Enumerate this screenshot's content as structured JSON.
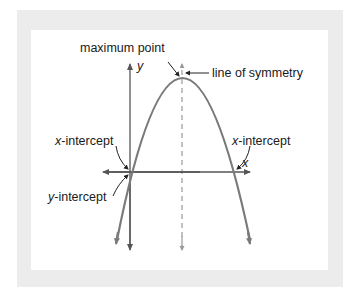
{
  "diagram": {
    "labels": {
      "maximum_point": "maximum point",
      "line_of_symmetry": "line of symmetry",
      "x_intercept_left_var": "x",
      "x_intercept_left_rest": "-intercept",
      "x_intercept_right_var": "x",
      "x_intercept_right_rest": "-intercept",
      "y_intercept_var": "y",
      "y_intercept_rest": "-intercept",
      "x_axis": "x",
      "y_axis": "y"
    },
    "colors": {
      "frame": "#ececec",
      "panel": "#ffffff",
      "curve": "#7a7a7a",
      "axes": "#555555",
      "symmetry_line": "#9a9a9a",
      "text": "#1a1a1a"
    }
  }
}
